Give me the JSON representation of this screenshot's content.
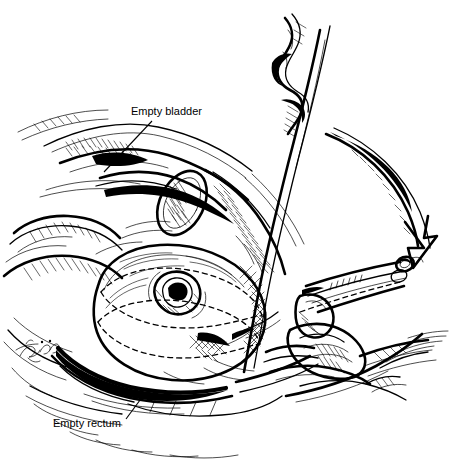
{
  "figure": {
    "style": "pen-and-ink line drawing",
    "background_color": "#ffffff",
    "ink_color": "#000000",
    "width": 453,
    "height": 468
  },
  "labels": [
    {
      "id": "empty-bladder",
      "text": "Empty bladder",
      "text_x": 131,
      "text_y": 115,
      "leader_from_x": 152,
      "leader_from_y": 121,
      "leader_to_x": 104,
      "leader_to_y": 172
    },
    {
      "id": "empty-rectum",
      "text": "Empty rectum",
      "text_x": 53,
      "text_y": 427,
      "leader_from_x": 126,
      "leader_from_y": 419,
      "leader_to_x": 146,
      "leader_to_y": 392
    }
  ],
  "annotations": {
    "motion_arrow": {
      "name": "rotation-arrow",
      "description": "large curved arrow indicating downward rotation of instrument handle",
      "direction": "clockwise-down-right"
    },
    "signature": {
      "name": "artist-signature",
      "description": "cursive artist signature, illegible",
      "x": 18,
      "y": 348
    }
  },
  "structures": [
    {
      "id": "abdominal-wall",
      "name": "anterior-abdominal-wall"
    },
    {
      "id": "empty-bladder-organ",
      "name": "empty-bladder"
    },
    {
      "id": "uterus",
      "name": "uterus-dashed-outline"
    },
    {
      "id": "cervix",
      "name": "cervix"
    },
    {
      "id": "empty-rectum-organ",
      "name": "empty-rectum"
    },
    {
      "id": "vagina",
      "name": "vaginal-canal"
    },
    {
      "id": "perineum",
      "name": "perineum"
    },
    {
      "id": "thigh",
      "name": "thigh"
    }
  ],
  "instrument": {
    "name": "uterine-manipulator",
    "parts": [
      {
        "id": "shaft",
        "name": "instrument-shaft"
      },
      {
        "id": "handle",
        "name": "instrument-handle-ratchet"
      },
      {
        "id": "finger-rings",
        "name": "instrument-finger-rings"
      },
      {
        "id": "tip",
        "name": "instrument-tip-in-cervix"
      }
    ]
  },
  "hand": {
    "name": "surgeon-hand",
    "description": "hand gripping instrument handle at lower right"
  }
}
